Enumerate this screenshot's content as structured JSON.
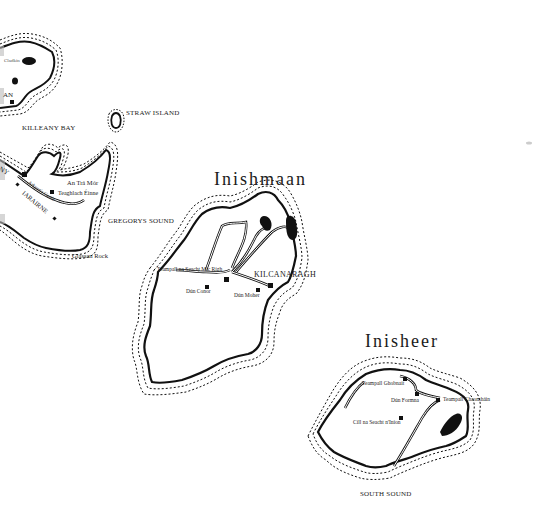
{
  "map": {
    "islands": [
      {
        "name": "Inishmaan",
        "places": [
          "Teampall na Seacht Mic Rígh",
          "Dún Conor",
          "Dún Moher",
          "KILCANARAGH"
        ]
      },
      {
        "name": "Inisheer",
        "places": [
          "Teampall Ghobnait",
          "Dún Formna",
          "Teampall Chaomháin",
          "Cill na Seacht n'Iníon"
        ]
      },
      {
        "name": "Inishmore (partial)",
        "places": [
          "An Trá Mór",
          "Teaghlach Éinne",
          "Arkyne's Castle",
          "IARAIRNE",
          "Glassan Rock",
          "AN",
          "NY",
          "Cladkin"
        ]
      }
    ],
    "water": [
      "KILLEANY BAY",
      "GREGORYS SOUND",
      "SOUTH SOUND"
    ],
    "other": [
      "STRAW ISLAND"
    ],
    "colors": {
      "ink": "#111111",
      "paper": "#ffffff"
    }
  },
  "labels": {
    "inishmaan_title": "Inishmaan",
    "inisheer_title": "Inisheer",
    "killeany_bay": "KILLEANY BAY",
    "straw_island": "STRAW ISLAND",
    "gregorys_sound": "GREGORYS SOUND",
    "south_sound": "SOUTH SOUND",
    "glassan_rock": "Glassan Rock",
    "an_tra_mor": "An Trá Mór",
    "teaghlach_einne": "Teaghlach Éinne",
    "arkynes_castle": "Arkyne's Castle",
    "iarairne": "IARAIRNE",
    "an_partial": "AN",
    "ny_partial": "NY",
    "cladkin": "Cladkin",
    "teampall_seacht": "Teampall na Seacht Mic Rígh",
    "dun_conor": "Dún Conor",
    "dun_moher": "Dún Moher",
    "kilcanaragh": "KILCANARAGH",
    "teampall_ghobnait": "Teampall Ghobnait",
    "dun_formna": "Dún Formna",
    "teampall_chaomhain": "Teampall Chaomháin",
    "cill_seacht": "Cill na Seacht n'Iníon"
  }
}
